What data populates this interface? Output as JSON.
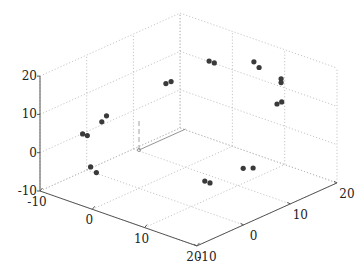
{
  "chart_data": {
    "type": "scatter3d",
    "title": "",
    "xlabel": "",
    "ylabel": "",
    "zlabel": "",
    "xlim": [
      -10,
      20
    ],
    "ylim": [
      -10,
      20
    ],
    "zlim": [
      -10,
      20
    ],
    "x_ticks": [
      "-10",
      "0",
      "10",
      "20"
    ],
    "y_ticks": [
      "-10",
      "0",
      "10",
      "20"
    ],
    "z_ticks": [
      "-10",
      "0",
      "10",
      "20"
    ],
    "grid": true,
    "legend": null,
    "marker_color": "#3a3a3a",
    "points": [
      {
        "x": -9,
        "y": -1,
        "z": 0
      },
      {
        "x": -9,
        "y": -2,
        "z": 1
      },
      {
        "x": -8,
        "y": 1,
        "z": 3
      },
      {
        "x": -8,
        "y": 2,
        "z": 4
      },
      {
        "x": -3,
        "y": -7,
        "z": -2
      },
      {
        "x": -1,
        "y": -8,
        "z": -2
      },
      {
        "x": -2,
        "y": 8,
        "z": 12
      },
      {
        "x": -1,
        "y": 8,
        "z": 13
      },
      {
        "x": 0,
        "y": 15,
        "z": 15
      },
      {
        "x": 1,
        "y": 15,
        "z": 15
      },
      {
        "x": 9,
        "y": 4,
        "z": -6
      },
      {
        "x": 10,
        "y": 4,
        "z": -6
      },
      {
        "x": 11,
        "y": 10,
        "z": -5
      },
      {
        "x": 12,
        "y": 11,
        "z": -5
      },
      {
        "x": 5,
        "y": 19,
        "z": 15
      },
      {
        "x": 6,
        "y": 19,
        "z": 14
      },
      {
        "x": 12,
        "y": 17,
        "z": 15
      },
      {
        "x": 12,
        "y": 17,
        "z": 14
      },
      {
        "x": 13,
        "y": 16,
        "z": 10
      },
      {
        "x": 13,
        "y": 15,
        "z": 10
      }
    ],
    "annotations": [
      {
        "type": "solid-line",
        "from": [
          0,
          0,
          0
        ],
        "to": [
          0,
          10,
          0
        ],
        "color": "#888888"
      },
      {
        "type": "dashed-line",
        "from": [
          0,
          0,
          0
        ],
        "to": [
          0,
          0,
          8
        ],
        "color": "#999999"
      }
    ]
  }
}
